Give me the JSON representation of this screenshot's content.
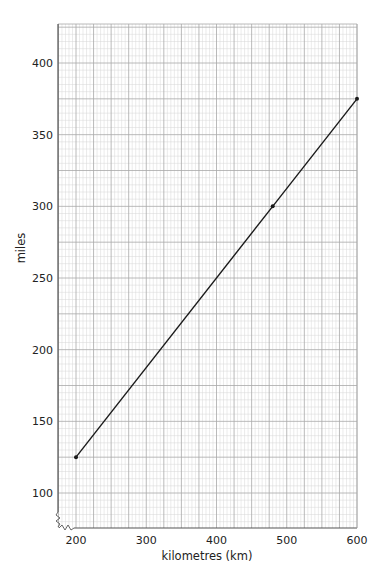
{
  "chart_data": {
    "type": "line",
    "title": "",
    "xlabel": "kilometres (km)",
    "ylabel": "miles",
    "xlim": [
      175,
      600
    ],
    "ylim": [
      75,
      427.5
    ],
    "x_ticks": [
      200,
      300,
      400,
      500,
      600
    ],
    "y_ticks": [
      100,
      150,
      200,
      250,
      300,
      350,
      400
    ],
    "grid": true,
    "grid_spacing": {
      "x_major": 25,
      "x_minor": 5,
      "y_major": 25,
      "y_minor": 5
    },
    "axis_break": "zigzag at origin (axes do not start at zero)",
    "series": [
      {
        "name": "km to miles conversion",
        "color": "#1a1a1a",
        "x": [
          200,
          480,
          600
        ],
        "y": [
          125,
          300,
          375
        ],
        "markers": [
          {
            "x": 200,
            "y": 125
          },
          {
            "x": 480,
            "y": 300
          },
          {
            "x": 600,
            "y": 375
          }
        ]
      }
    ]
  },
  "colors": {
    "grid_minor": "#d6d6d6",
    "grid_major": "#a8a8a8",
    "axis": "#555555",
    "line": "#1a1a1a",
    "text": "#222222"
  }
}
